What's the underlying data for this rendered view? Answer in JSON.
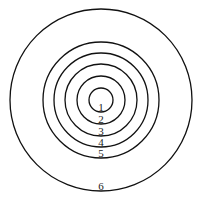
{
  "diagram": {
    "type": "concentric-circles",
    "center": {
      "x": 101,
      "y": 100
    },
    "stroke_color": "#111111",
    "background": "#ffffff",
    "rings": [
      {
        "label": "1",
        "radius": 12
      },
      {
        "label": "2",
        "radius": 24
      },
      {
        "label": "3",
        "radius": 36
      },
      {
        "label": "4",
        "radius": 47
      },
      {
        "label": "5",
        "radius": 58
      },
      {
        "label": "6",
        "radius": 91
      }
    ],
    "labels": {
      "l1": "1",
      "l2": "2",
      "l3": "3",
      "l4": "4",
      "l5": "5",
      "l6": "6"
    }
  }
}
